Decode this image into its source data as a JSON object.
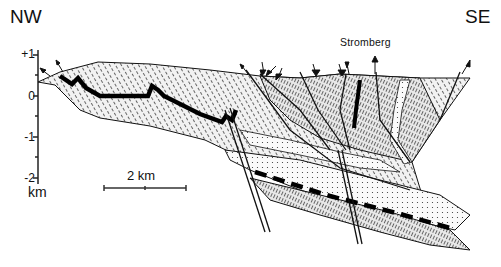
{
  "diagram": {
    "type": "geological-cross-section",
    "orientation": {
      "left": "NW",
      "right": "SE"
    },
    "place_label": "Stromberg",
    "vertical_axis": {
      "unit": "km",
      "ticks": [
        "+1",
        "0",
        "-1",
        "-2"
      ]
    },
    "scale_bar": {
      "label": "2 km"
    },
    "colors": {
      "ink": "#111111",
      "fill_light": "#e6e6e6",
      "fill_mid": "#cfcfcf",
      "background": "#ffffff"
    }
  }
}
